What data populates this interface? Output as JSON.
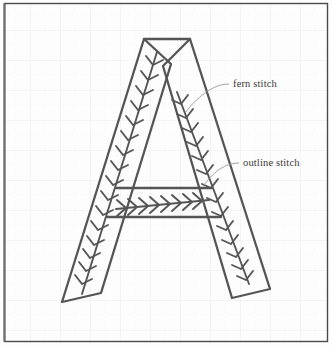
{
  "figure": {
    "subject_letter": "A",
    "background_color": "#fdfdfd",
    "grid_color": "#ececec",
    "grid_spacing_px": 30,
    "frame_color": "#4a4a4a",
    "stroke_color": "#555555",
    "stitch_color": "#555555",
    "leader_color": "#9a9a9a",
    "text_color": "#3a3a3a"
  },
  "labels": [
    {
      "id": "fern-stitch",
      "text": "fern stitch",
      "x": 233,
      "y": 87,
      "leader": "M 229 84 C 221 84 213 87 205 93 C 197 99 190 106 186 112",
      "describes": "decorative branching stitch running down the centre of each stroke"
    },
    {
      "id": "outline-stitch",
      "text": "outline stitch",
      "x": 243,
      "y": 166,
      "leader": "M 239 163 C 231 163 223 166 216 172 C 211 176 207 181 204 185",
      "describes": "continuous line stitch forming the edges of the letter"
    }
  ],
  "letter_geometry": {
    "apex_top_left": [
      144,
      39
    ],
    "apex_top_right": [
      190,
      39
    ],
    "left_foot_outer": [
      62,
      302
    ],
    "left_foot_inner": [
      101,
      293
    ],
    "right_foot_outer": [
      270,
      289
    ],
    "right_foot_inner": [
      232,
      298
    ],
    "crossbar_top_y": 188,
    "crossbar_bottom_y": 217
  },
  "fern_stitch_runs": [
    {
      "id": "left-stroke-fern",
      "description": "fern stitch down the left diagonal stroke",
      "barb_count": 17
    },
    {
      "id": "right-stroke-fern",
      "description": "fern stitch down the right diagonal stroke",
      "barb_count": 15
    },
    {
      "id": "crossbar-fern",
      "description": "horizontal fern stitch across the crossbar",
      "barb_count": 9
    }
  ]
}
